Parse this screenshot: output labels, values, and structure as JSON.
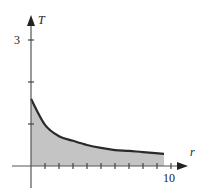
{
  "chart_data": {
    "type": "area",
    "title": "",
    "xlabel": "r",
    "ylabel": "T",
    "x_tick_labels": [
      "10"
    ],
    "y_tick_labels": [
      "3"
    ],
    "x_ticks": [
      1,
      2,
      3,
      4,
      5,
      6,
      7,
      8,
      9,
      10
    ],
    "y_ticks": [
      1,
      2,
      3
    ],
    "xlim": [
      0,
      10
    ],
    "ylim": [
      0,
      3
    ],
    "grid": false,
    "legend": null,
    "series": [
      {
        "name": "T(r)",
        "x": [
          0,
          1,
          2,
          3,
          4,
          5,
          6,
          7,
          8,
          9.5
        ],
        "values": [
          1.6,
          0.98,
          0.71,
          0.6,
          0.5,
          0.43,
          0.38,
          0.36,
          0.33,
          0.29
        ],
        "fill": "shaded area under curve"
      }
    ],
    "colors": {
      "curve": "#2a2a2a",
      "fill": "#c4c4c4",
      "axis": "#555555"
    }
  }
}
